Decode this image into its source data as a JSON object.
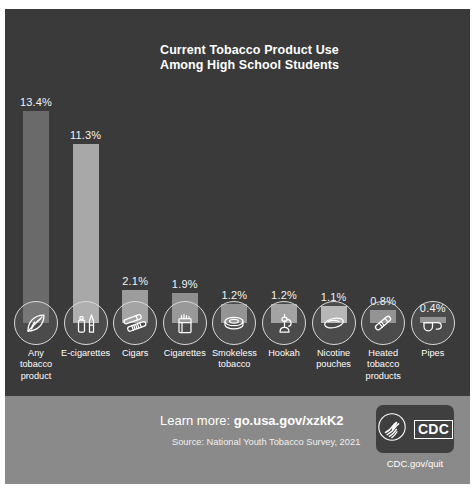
{
  "poster": {
    "title_line1": "Current Tobacco Product Use",
    "title_line2": "Among High School Students",
    "background_color": "#3a3a3a",
    "footer_color": "#8a8a8a"
  },
  "chart_data": {
    "type": "bar",
    "title": "Current Tobacco Product Use Among High School Students",
    "xlabel": "",
    "ylabel": "",
    "ylim": [
      0,
      13.4
    ],
    "grid": false,
    "legend": false,
    "value_suffix": "%",
    "categories": [
      "Any tobacco product",
      "E-cigarettes",
      "Cigars",
      "Cigarettes",
      "Smokeless tobacco",
      "Hookah",
      "Nicotine pouches",
      "Heated tobacco products",
      "Pipes"
    ],
    "values": [
      13.4,
      11.3,
      2.1,
      1.9,
      1.2,
      1.2,
      1.1,
      0.8,
      0.4
    ],
    "value_labels": [
      "13.4%",
      "11.3%",
      "2.1%",
      "1.9%",
      "1.2%",
      "1.2%",
      "1.1%",
      "0.8%",
      "0.4%"
    ],
    "bars": [
      {
        "label_lines": [
          "Any",
          "tobacco",
          "product"
        ],
        "value_label": "13.4%",
        "icon": "tobacco-leaf-icon",
        "color": "#6a6a6a"
      },
      {
        "label_lines": [
          "E-cigarettes"
        ],
        "value_label": "11.3%",
        "icon": "e-cigarette-icon",
        "color": "#a8a8a8"
      },
      {
        "label_lines": [
          "Cigars"
        ],
        "value_label": "2.1%",
        "icon": "cigars-icon",
        "color": "#9c9c9c"
      },
      {
        "label_lines": [
          "Cigarettes"
        ],
        "value_label": "1.9%",
        "icon": "cigarette-pack-icon",
        "color": "#8f8f8f"
      },
      {
        "label_lines": [
          "Smokeless",
          "tobacco"
        ],
        "value_label": "1.2%",
        "icon": "smokeless-tin-icon",
        "color": "#8a8a8a"
      },
      {
        "label_lines": [
          "Hookah"
        ],
        "value_label": "1.2%",
        "icon": "hookah-icon",
        "color": "#9a9a9a"
      },
      {
        "label_lines": [
          "Nicotine",
          "pouches"
        ],
        "value_label": "1.1%",
        "icon": "nicotine-pouch-icon",
        "color": "#b0b0b0"
      },
      {
        "label_lines": [
          "Heated",
          "tobacco",
          "products"
        ],
        "value_label": "0.8%",
        "icon": "heated-tobacco-icon",
        "color": "#8a8a8a"
      },
      {
        "label_lines": [
          "Pipes"
        ],
        "value_label": "0.4%",
        "icon": "pipe-icon",
        "color": "#8a8a8a"
      }
    ]
  },
  "footer": {
    "learn_prefix": "Learn more: ",
    "learn_url": "go.usa.gov/xzkK2",
    "source": "Source: National Youth Tobacco Survey, 2021",
    "logo_text": "CDC",
    "logo_caption": "CDC.gov/quit"
  }
}
